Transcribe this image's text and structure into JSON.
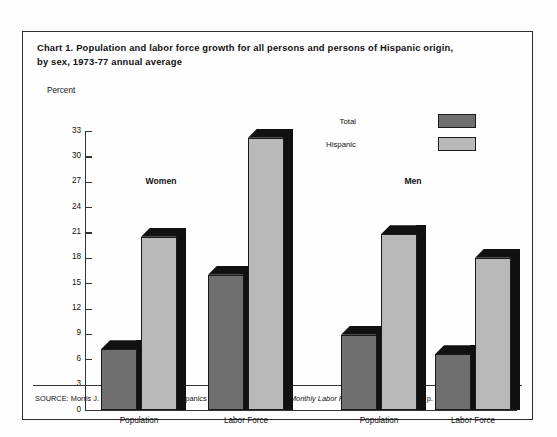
{
  "chart_data": {
    "type": "bar",
    "title": "Chart 1.  Population and labor force growth for all persons and persons of Hispanic origin, by sex, 1973-77 annual average",
    "title_line1": "Chart 1.  Population and labor force growth for all persons and persons of Hispanic origin,",
    "title_line2": "by sex, 1973-77 annual average",
    "xlabel": "",
    "ylabel": "Percent",
    "ylim": [
      0,
      33
    ],
    "ytick_step": 3,
    "yticks": [
      33,
      30,
      27,
      24,
      21,
      18,
      15,
      12,
      9,
      6,
      3,
      0
    ],
    "ytick_labels": [
      "33",
      "30",
      "27",
      "24",
      "21",
      "18",
      "15",
      "12",
      "9",
      "6",
      "3",
      "0"
    ],
    "grid": false,
    "legend_position": "top-right",
    "groups": [
      "Women",
      "Men"
    ],
    "categories": [
      "Population",
      "Labor Force",
      "Population",
      "Labor Force"
    ],
    "series": [
      {
        "name": "Total",
        "color": "#6f6f6f",
        "values": [
          7.2,
          16.0,
          8.9,
          6.6
        ]
      },
      {
        "name": "Hispanic",
        "color": "#b9b9b9",
        "values": [
          20.5,
          32.2,
          20.8,
          18.0
        ]
      }
    ],
    "bars": [
      {
        "group": "Women",
        "category": "Population",
        "series": "Total",
        "value": 7.2
      },
      {
        "group": "Women",
        "category": "Population",
        "series": "Hispanic",
        "value": 20.5
      },
      {
        "group": "Women",
        "category": "Labor Force",
        "series": "Total",
        "value": 16.0
      },
      {
        "group": "Women",
        "category": "Labor Force",
        "series": "Hispanic",
        "value": 32.2
      },
      {
        "group": "Men",
        "category": "Population",
        "series": "Total",
        "value": 8.9
      },
      {
        "group": "Men",
        "category": "Population",
        "series": "Hispanic",
        "value": 20.8
      },
      {
        "group": "Men",
        "category": "Labor Force",
        "series": "Total",
        "value": 6.6
      },
      {
        "group": "Men",
        "category": "Labor Force",
        "series": "Hispanic",
        "value": 18.0
      }
    ],
    "colors": {
      "total": "#6f6f6f",
      "hispanic": "#b9b9b9",
      "bar_shadow": "#111111",
      "axis": "#333333",
      "frame": "#2b2b2b",
      "background": "#fefefe"
    }
  },
  "legend": {
    "items": [
      {
        "label": "Total"
      },
      {
        "label": "Hispanic"
      }
    ]
  },
  "axis": {
    "unit_label": "Percent"
  },
  "group_labels": {
    "women": "Women",
    "men": "Men"
  },
  "category_labels": {
    "women_population": "Population",
    "women_labor_force": "Labor Force",
    "men_population": "Population",
    "men_labor_force": "Labor Force"
  },
  "source": {
    "prefix": "SOURCE: Morris J. Newman, “A Profile of Hispanics in the U.S. Work Force,” ",
    "publication": "Monthly Labor Review",
    "suffix": " (December 1978), p. 6."
  }
}
